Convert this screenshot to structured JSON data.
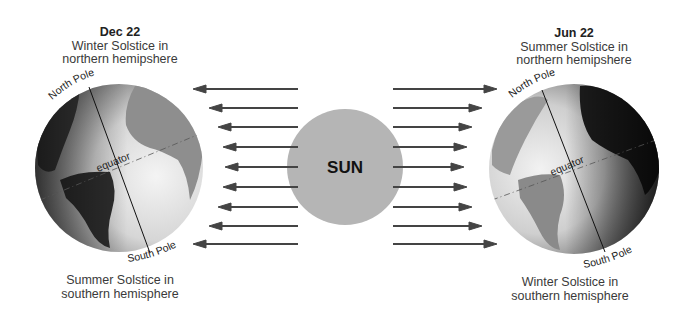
{
  "sun": {
    "label": "SUN",
    "color": "#b5b5b5"
  },
  "left_globe": {
    "date": "Dec 22",
    "top_caption_line1": "Winter Solstice in",
    "top_caption_line2": "northern hemipshere",
    "bottom_caption_line1": "Summer Solstice in",
    "bottom_caption_line2": "southern hemisphere",
    "north_label": "North Pole",
    "south_label": "South Pole",
    "equator_label": "equator"
  },
  "right_globe": {
    "date": "Jun 22",
    "top_caption_line1": "Summer Solstice in",
    "top_caption_line2": "northern hemipshere",
    "bottom_caption_line1": "Winter Solstice in",
    "bottom_caption_line2": "southern hemisphere",
    "north_label": "North Pole",
    "south_label": "South Pole",
    "equator_label": "equator"
  },
  "arrows": {
    "color": "#444444",
    "count_each_side": 9
  }
}
